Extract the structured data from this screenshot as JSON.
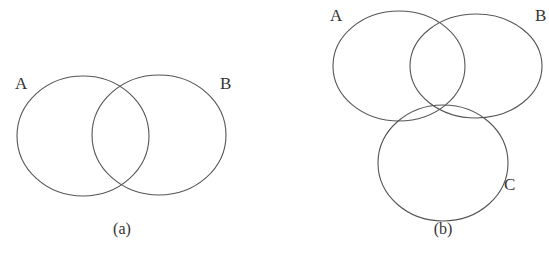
{
  "figures": [
    {
      "caption": "(a)",
      "sets": [
        {
          "label": "A",
          "cx": 83,
          "cy": 136,
          "rx": 66,
          "ry": 60,
          "lx": 21,
          "ly": 89
        },
        {
          "label": "B",
          "cx": 159,
          "cy": 135,
          "rx": 67,
          "ry": 60,
          "lx": 226,
          "ly": 89
        }
      ],
      "caption_x": 122,
      "caption_y": 234
    },
    {
      "caption": "(b)",
      "sets": [
        {
          "label": "A",
          "cx": 399,
          "cy": 66,
          "rx": 66,
          "ry": 55,
          "lx": 336,
          "ly": 21
        },
        {
          "label": "B",
          "cx": 476,
          "cy": 66,
          "rx": 66,
          "ry": 52,
          "lx": 541,
          "ly": 21
        },
        {
          "label": "C",
          "cx": 443,
          "cy": 163,
          "rx": 65,
          "ry": 58,
          "lx": 510,
          "ly": 190
        }
      ],
      "caption_x": 443,
      "caption_y": 234
    }
  ],
  "stroke_color": "#555555"
}
